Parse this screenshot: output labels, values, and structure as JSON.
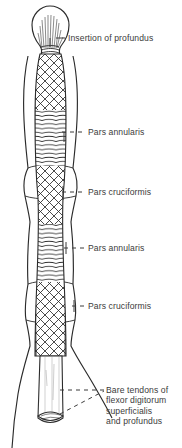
{
  "figure": {
    "ink_color": "#2b2b2b",
    "text_color": "#3b3b3b",
    "background_color": "#ffffff"
  },
  "labels": [
    {
      "id": "insertion-of-profundus",
      "text": "Insertion of profundus",
      "leader": "solid-dash"
    },
    {
      "id": "pars-annularis-distal",
      "text": "Pars annularis",
      "leader": "dashed"
    },
    {
      "id": "pars-cruciformis-distal",
      "text": "Pars cruciformis",
      "leader": "dashed"
    },
    {
      "id": "pars-annularis-proximal",
      "text": "Pars annularis",
      "leader": "dashed"
    },
    {
      "id": "pars-cruciformis-proximal",
      "text": "Pars cruciformis",
      "leader": "dashed"
    },
    {
      "id": "bare-tendons",
      "leader": "dashed-angled",
      "lines": [
        "Bare tendons of",
        "flexor digitorum",
        "superficialis",
        "and profundus"
      ]
    }
  ]
}
